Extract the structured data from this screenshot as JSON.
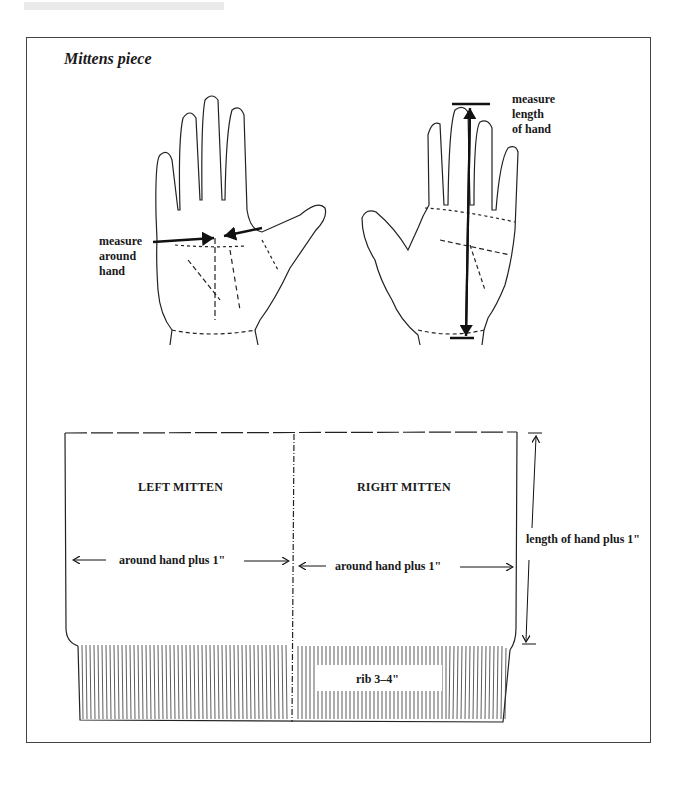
{
  "figure": {
    "title": "Mittens piece",
    "left_hand": {
      "annotation": [
        "measure",
        "around",
        "hand"
      ]
    },
    "right_hand": {
      "annotation": [
        "measure",
        "length",
        "of hand"
      ]
    },
    "pattern": {
      "left_panel_label": "LEFT MITTEN",
      "right_panel_label": "RIGHT MITTEN",
      "left_width_label": "around hand plus 1\"",
      "right_width_label": "around hand plus 1\"",
      "height_label": "length of hand plus 1\"",
      "rib_label": "rib 3–4\""
    }
  }
}
